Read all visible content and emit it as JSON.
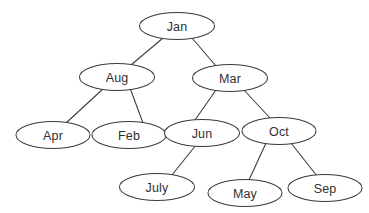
{
  "diagram": {
    "type": "tree",
    "background_color": "#ffffff",
    "stroke_color": "#3a3a3a",
    "text_color": "#303030",
    "node_shape": "ellipse",
    "node_width": 75,
    "node_height": 27,
    "nodes": [
      {
        "id": "jan",
        "label": "Jan",
        "cx": 177,
        "cy": 26,
        "rx": 37.5,
        "ry": 13.5,
        "level": 0
      },
      {
        "id": "aug",
        "label": "Aug",
        "cx": 117,
        "cy": 77,
        "rx": 37.5,
        "ry": 13.5,
        "level": 1
      },
      {
        "id": "mar",
        "label": "Mar",
        "cx": 230,
        "cy": 78,
        "rx": 37.5,
        "ry": 13.5,
        "level": 1
      },
      {
        "id": "apr",
        "label": "Apr",
        "cx": 53,
        "cy": 135,
        "rx": 37.0,
        "ry": 13.5,
        "level": 2
      },
      {
        "id": "feb",
        "label": "Feb",
        "cx": 129,
        "cy": 135,
        "rx": 37.0,
        "ry": 13.5,
        "level": 2
      },
      {
        "id": "jun",
        "label": "Jun",
        "cx": 202,
        "cy": 133,
        "rx": 37.5,
        "ry": 13.5,
        "level": 2
      },
      {
        "id": "oct",
        "label": "Oct",
        "cx": 279,
        "cy": 131,
        "rx": 37.0,
        "ry": 13.5,
        "level": 2
      },
      {
        "id": "july",
        "label": "July",
        "cx": 157,
        "cy": 187,
        "rx": 37.5,
        "ry": 13.5,
        "level": 3
      },
      {
        "id": "may",
        "label": "May",
        "cx": 245,
        "cy": 193,
        "rx": 37.0,
        "ry": 13.5,
        "level": 3
      },
      {
        "id": "sep",
        "label": "Sep",
        "cx": 325,
        "cy": 188,
        "rx": 37.0,
        "ry": 13.5,
        "level": 3
      }
    ],
    "edges": [
      {
        "id": "jan-aug",
        "from": "jan",
        "to": "aug",
        "x1": 163,
        "y1": 38,
        "x2": 131,
        "y2": 65
      },
      {
        "id": "jan-mar",
        "from": "jan",
        "to": "mar",
        "x1": 192,
        "y1": 38,
        "x2": 216,
        "y2": 66
      },
      {
        "id": "aug-apr",
        "from": "aug",
        "to": "apr",
        "x1": 104,
        "y1": 88,
        "x2": 66,
        "y2": 123
      },
      {
        "id": "aug-feb",
        "from": "aug",
        "to": "feb",
        "x1": 130,
        "y1": 88,
        "x2": 143,
        "y2": 123
      },
      {
        "id": "mar-jun",
        "from": "mar",
        "to": "jun",
        "x1": 216,
        "y1": 90,
        "x2": 195,
        "y2": 120
      },
      {
        "id": "mar-oct",
        "from": "mar",
        "to": "oct",
        "x1": 244,
        "y1": 90,
        "x2": 270,
        "y2": 118
      },
      {
        "id": "jun-july",
        "from": "jun",
        "to": "july",
        "x1": 196,
        "y1": 145,
        "x2": 172,
        "y2": 175
      },
      {
        "id": "oct-may",
        "from": "oct",
        "to": "may",
        "x1": 266,
        "y1": 143,
        "x2": 249,
        "y2": 180
      },
      {
        "id": "oct-sep",
        "from": "oct",
        "to": "sep",
        "x1": 291,
        "y1": 143,
        "x2": 317,
        "y2": 176
      }
    ]
  }
}
